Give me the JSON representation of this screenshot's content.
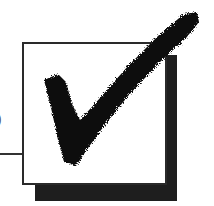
{
  "figure": {
    "edge_glyph": ")",
    "colors": {
      "frame": "#2a2a2a",
      "shadow": "#1e1e1e",
      "check": "#111111",
      "background": "#ffffff"
    }
  }
}
